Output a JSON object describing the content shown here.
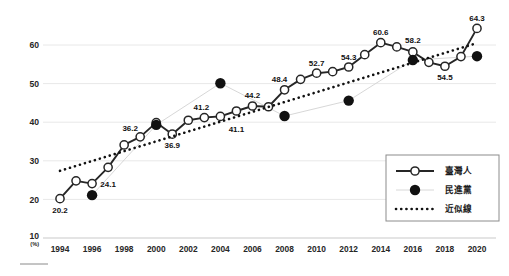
{
  "chart_data": {
    "type": "line",
    "title": "",
    "xlabel": "",
    "ylabel": "(%)",
    "unit_label": "(%)",
    "grid": true,
    "legend_position": "bottom-right",
    "xlim": [
      1994,
      2020
    ],
    "ylim": [
      10,
      68
    ],
    "y_ticks": [
      10,
      20,
      30,
      40,
      50,
      60
    ],
    "x_ticks": [
      1994,
      1996,
      1998,
      2000,
      2002,
      2004,
      2006,
      2008,
      2010,
      2012,
      2014,
      2016,
      2018,
      2020
    ],
    "x": [
      1994,
      1995,
      1996,
      1997,
      1998,
      1999,
      2000,
      2001,
      2002,
      2003,
      2004,
      2005,
      2006,
      2007,
      2008,
      2009,
      2010,
      2011,
      2012,
      2013,
      2014,
      2015,
      2016,
      2017,
      2018,
      2019,
      2020
    ],
    "series": [
      {
        "name": "臺灣人",
        "legend_key": "taiwanese",
        "marker": "open-circle",
        "values": [
          20.2,
          24.8,
          24.1,
          28.3,
          34.1,
          36.2,
          39.9,
          36.9,
          40.5,
          41.2,
          41.5,
          42.9,
          44.2,
          44.0,
          48.4,
          51.1,
          52.7,
          53.1,
          54.3,
          57.5,
          60.6,
          59.5,
          58.2,
          55.5,
          54.5,
          57.0,
          64.3
        ],
        "labeled_points": [
          {
            "x": 1994,
            "value": 20.2,
            "label": "20.2"
          },
          {
            "x": 1996,
            "value": 24.1,
            "label": "24.1"
          },
          {
            "x": 1999,
            "value": 36.2,
            "label": "36.2"
          },
          {
            "x": 2001,
            "value": 36.9,
            "label": "36.9"
          },
          {
            "x": 2003,
            "value": 41.2,
            "label": "41.2"
          },
          {
            "x": 2005,
            "value": 41.1,
            "label": "41.1"
          },
          {
            "x": 2006,
            "value": 44.2,
            "label": "44.2"
          },
          {
            "x": 2008,
            "value": 48.4,
            "label": "48.4"
          },
          {
            "x": 2010,
            "value": 52.7,
            "label": "52.7"
          },
          {
            "x": 2012,
            "value": 54.3,
            "label": "54.3"
          },
          {
            "x": 2014,
            "value": 60.6,
            "label": "60.6"
          },
          {
            "x": 2016,
            "value": 58.2,
            "label": "58.2"
          },
          {
            "x": 2018,
            "value": 54.5,
            "label": "54.5"
          },
          {
            "x": 2020,
            "value": 64.3,
            "label": "64.3"
          }
        ]
      },
      {
        "name": "民進黨",
        "legend_key": "dpp",
        "marker": "filled-circle",
        "points": [
          {
            "x": 1996,
            "value": 21.1
          },
          {
            "x": 2000,
            "value": 39.3
          },
          {
            "x": 2004,
            "value": 50.1
          },
          {
            "x": 2008,
            "value": 41.6
          },
          {
            "x": 2012,
            "value": 45.6
          },
          {
            "x": 2016,
            "value": 56.1
          },
          {
            "x": 2020,
            "value": 57.1
          }
        ]
      },
      {
        "name": "近似線",
        "legend_key": "trendline",
        "marker": "dotted",
        "endpoints": [
          {
            "x": 1994,
            "value": 27.4
          },
          {
            "x": 2020,
            "value": 60.5
          }
        ]
      }
    ]
  },
  "axes": {
    "y_tick_labels": [
      "60",
      "50",
      "40",
      "30",
      "20",
      "10"
    ],
    "x_tick_labels": [
      "1994",
      "1996",
      "1998",
      "2000",
      "2002",
      "2004",
      "2006",
      "2008",
      "2010",
      "2012",
      "2014",
      "2016",
      "2018",
      "2020"
    ],
    "unit": "(%)"
  },
  "legend": {
    "items": [
      {
        "label": "臺灣人",
        "style": "line-open-circle"
      },
      {
        "label": "民進黨",
        "style": "filled-circle"
      },
      {
        "label": "近似線",
        "style": "dotted-line"
      }
    ]
  }
}
